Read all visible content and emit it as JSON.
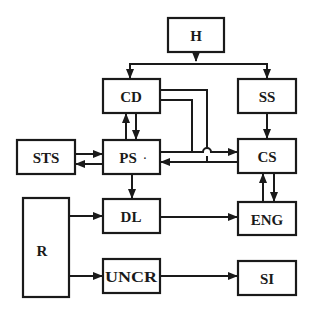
{
  "diagram": {
    "type": "block-diagram",
    "colors": {
      "stroke": "#1a1a1a",
      "background": "#ffffff"
    },
    "blocks": [
      {
        "id": "H",
        "label": "H",
        "x": 168,
        "y": 18,
        "w": 56,
        "h": 34
      },
      {
        "id": "CD",
        "label": "CD",
        "x": 103,
        "y": 79,
        "w": 57,
        "h": 34
      },
      {
        "id": "SS",
        "label": "SS",
        "x": 238,
        "y": 79,
        "w": 58,
        "h": 34
      },
      {
        "id": "STS",
        "label": "STS",
        "x": 17,
        "y": 140,
        "w": 58,
        "h": 34
      },
      {
        "id": "PS",
        "label": "PS",
        "x": 103,
        "y": 140,
        "w": 57,
        "h": 34
      },
      {
        "id": "CS",
        "label": "CS",
        "x": 238,
        "y": 139,
        "w": 58,
        "h": 34
      },
      {
        "id": "DL",
        "label": "DL",
        "x": 103,
        "y": 199,
        "w": 57,
        "h": 34
      },
      {
        "id": "ENG",
        "label": "ENG",
        "x": 238,
        "y": 202,
        "w": 58,
        "h": 33
      },
      {
        "id": "R",
        "label": "R",
        "x": 23,
        "y": 198,
        "w": 46,
        "h": 99
      },
      {
        "id": "UNCR",
        "label": "UNCR",
        "x": 103,
        "y": 259,
        "w": 57,
        "h": 34
      },
      {
        "id": "SI",
        "label": "SI",
        "x": 238,
        "y": 261,
        "w": 58,
        "h": 34
      }
    ],
    "connections": [
      {
        "from": "H",
        "to": "CD"
      },
      {
        "from": "H",
        "to": "SS"
      },
      {
        "from": "SS",
        "to": "CS"
      },
      {
        "from": "PS",
        "to": "CD"
      },
      {
        "from": "CD",
        "to": "PS"
      },
      {
        "from": "STS",
        "to": "PS"
      },
      {
        "from": "PS",
        "to": "STS"
      },
      {
        "from": "PS",
        "to": "CS"
      },
      {
        "from": "CS",
        "to": "PS"
      },
      {
        "from": "CD",
        "to": "CS",
        "note": "joins PS→CS line"
      },
      {
        "from": "CD",
        "to": "PS",
        "note": "joins CS→PS return line, hop-over crossing"
      },
      {
        "from": "PS",
        "to": "DL"
      },
      {
        "from": "ENG",
        "to": "CS"
      },
      {
        "from": "CS",
        "to": "ENG"
      },
      {
        "from": "R",
        "to": "DL"
      },
      {
        "from": "DL",
        "to": "ENG"
      },
      {
        "from": "R",
        "to": "UNCR"
      },
      {
        "from": "UNCR",
        "to": "SI"
      }
    ]
  },
  "labels": {
    "H": "H",
    "CD": "CD",
    "SS": "SS",
    "STS": "STS",
    "PS": "PS",
    "PS_dot": "·",
    "CS": "CS",
    "DL": "DL",
    "ENG": "ENG",
    "R": "R",
    "UNCR": "UNCR",
    "SI": "SI"
  }
}
